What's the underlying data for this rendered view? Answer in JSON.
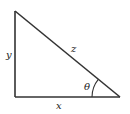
{
  "diagram": {
    "type": "right-triangle",
    "stroke_color": "#333333",
    "vertices": {
      "top": [
        15,
        11
      ],
      "right_angle": [
        15,
        97
      ],
      "acute": [
        120,
        97
      ]
    },
    "labels": {
      "vertical_side": "y",
      "hypotenuse": "z",
      "angle": "θ",
      "horizontal_side": "x"
    },
    "angle_arc_radius": 28
  }
}
